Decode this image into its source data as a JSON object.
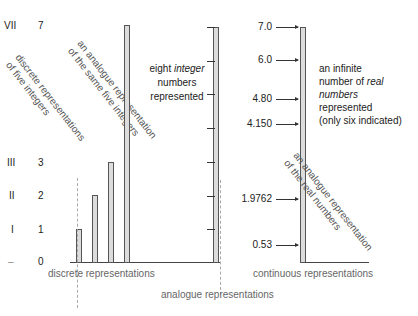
{
  "left_axis": {
    "roman": [
      "VII",
      "III",
      "II",
      "I",
      "–"
    ],
    "arabic": [
      "7",
      "3",
      "2",
      "1",
      "0"
    ]
  },
  "discrete": {
    "rotated_label_line1": "discrete representations",
    "rotated_label_line2": "of five integers",
    "bar_values": [
      1,
      2,
      3,
      7
    ],
    "bottom_label": "discrete representations"
  },
  "analogue_integers": {
    "rotated_label_line1": "an analogue representation",
    "rotated_label_line2": "of the same five integers",
    "text_line1_prefix": "eight ",
    "text_line1_italic": "integer",
    "text_line2": "numbers",
    "text_line3": "represented",
    "tick_count": 8
  },
  "continuous": {
    "values": [
      "7.0",
      "6.0",
      "4.80",
      "4.150",
      "1.9762",
      "0.53"
    ],
    "text_line1": "an infinite",
    "text_line2_prefix": "number of ",
    "text_line2_italic": "real",
    "text_line3_italic": "numbers",
    "text_line4": "represented",
    "text_line5": "(only six indicated)",
    "rotated_label_line1": "an analogue representation",
    "rotated_label_line2": "of the real numbers",
    "bottom_label": "continuous representations"
  },
  "footer": {
    "analogue_label": "analogue representations"
  }
}
